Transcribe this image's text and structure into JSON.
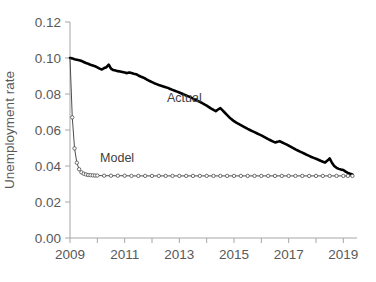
{
  "chart_data": {
    "type": "line",
    "title": "",
    "xlabel": "",
    "ylabel": "Unemployment rate",
    "xlim": [
      2009.0,
      2019.5
    ],
    "ylim": [
      0.0,
      0.12
    ],
    "grid": false,
    "legend_position": "inline-annotations",
    "y_ticks": [
      "0.00",
      "0.02",
      "0.04",
      "0.06",
      "0.08",
      "0.10",
      "0.12"
    ],
    "y_tick_values": [
      0.0,
      0.02,
      0.04,
      0.06,
      0.08,
      0.1,
      0.12
    ],
    "x_ticks": [
      "2009",
      "2011",
      "2013",
      "2015",
      "2017",
      "2019"
    ],
    "x_tick_values": [
      2009,
      2011,
      2013,
      2015,
      2017,
      2019
    ],
    "x_minor_tick_values": [
      2010,
      2012,
      2014,
      2016,
      2018
    ],
    "annotations": [
      {
        "text": "Actual",
        "x": 2012.55,
        "y": 0.0757
      },
      {
        "text": "Model",
        "x": 2010.1,
        "y": 0.0423
      }
    ],
    "series": [
      {
        "name": "Actual",
        "style": "thick-solid-black",
        "color": "#000000",
        "x": [
          2009.0,
          2009.083,
          2009.167,
          2009.25,
          2009.333,
          2009.417,
          2009.5,
          2009.583,
          2009.667,
          2009.75,
          2009.833,
          2009.917,
          2010.0,
          2010.083,
          2010.167,
          2010.25,
          2010.333,
          2010.417,
          2010.5,
          2010.583,
          2010.667,
          2010.75,
          2010.833,
          2010.917,
          2011.0,
          2011.083,
          2011.167,
          2011.25,
          2011.333,
          2011.417,
          2011.5,
          2011.583,
          2011.667,
          2011.75,
          2011.833,
          2011.917,
          2012.0,
          2012.083,
          2012.167,
          2012.25,
          2012.333,
          2012.417,
          2012.5,
          2012.583,
          2012.667,
          2012.75,
          2012.833,
          2012.917,
          2013.0,
          2013.083,
          2013.167,
          2013.25,
          2013.333,
          2013.417,
          2013.5,
          2013.583,
          2013.667,
          2013.75,
          2013.833,
          2013.917,
          2014.0,
          2014.083,
          2014.167,
          2014.25,
          2014.333,
          2014.417,
          2014.5,
          2014.583,
          2014.667,
          2014.75,
          2014.833,
          2014.917,
          2015.0,
          2015.083,
          2015.167,
          2015.25,
          2015.333,
          2015.417,
          2015.5,
          2015.583,
          2015.667,
          2015.75,
          2015.833,
          2015.917,
          2016.0,
          2016.083,
          2016.167,
          2016.25,
          2016.333,
          2016.417,
          2016.5,
          2016.583,
          2016.667,
          2016.75,
          2016.833,
          2016.917,
          2017.0,
          2017.083,
          2017.167,
          2017.25,
          2017.333,
          2017.417,
          2017.5,
          2017.583,
          2017.667,
          2017.75,
          2017.833,
          2017.917,
          2018.0,
          2018.083,
          2018.167,
          2018.25,
          2018.333,
          2018.417,
          2018.5,
          2018.583,
          2018.667,
          2018.75,
          2018.833,
          2018.917,
          2019.0,
          2019.083,
          2019.167,
          2019.25,
          2019.333
        ],
        "y": [
          0.1,
          0.0998,
          0.0993,
          0.099,
          0.0987,
          0.0984,
          0.0978,
          0.0972,
          0.0968,
          0.0962,
          0.0958,
          0.0954,
          0.0948,
          0.0941,
          0.0936,
          0.0944,
          0.0949,
          0.0963,
          0.0941,
          0.0933,
          0.093,
          0.0927,
          0.0925,
          0.0922,
          0.0919,
          0.0916,
          0.092,
          0.0917,
          0.0913,
          0.091,
          0.0903,
          0.0897,
          0.0892,
          0.0886,
          0.0879,
          0.0872,
          0.0866,
          0.086,
          0.0855,
          0.085,
          0.0846,
          0.0842,
          0.0838,
          0.0834,
          0.0828,
          0.0823,
          0.0818,
          0.0813,
          0.0808,
          0.0803,
          0.0797,
          0.0792,
          0.0787,
          0.0781,
          0.0774,
          0.0768,
          0.0762,
          0.0756,
          0.075,
          0.0742,
          0.0735,
          0.0727,
          0.0719,
          0.0712,
          0.0705,
          0.0714,
          0.0722,
          0.0709,
          0.0696,
          0.0683,
          0.067,
          0.0659,
          0.0649,
          0.0641,
          0.0634,
          0.0627,
          0.062,
          0.0613,
          0.0606,
          0.06,
          0.0594,
          0.0588,
          0.0582,
          0.0576,
          0.057,
          0.0563,
          0.0556,
          0.0549,
          0.0543,
          0.0537,
          0.0531,
          0.0534,
          0.0538,
          0.0532,
          0.0526,
          0.052,
          0.0513,
          0.0506,
          0.0499,
          0.0492,
          0.0486,
          0.048,
          0.0474,
          0.0468,
          0.0462,
          0.0456,
          0.045,
          0.0445,
          0.044,
          0.0435,
          0.0429,
          0.0424,
          0.0419,
          0.043,
          0.0442,
          0.0418,
          0.04,
          0.039,
          0.0384,
          0.038,
          0.0378,
          0.0369,
          0.0362,
          0.0357,
          0.0353
        ]
      },
      {
        "name": "Model",
        "style": "thin-line-open-circle-markers",
        "color": "#4d4d4d",
        "marker": "open-circle",
        "x": [
          2009.0,
          2009.083,
          2009.167,
          2009.25,
          2009.333,
          2009.417,
          2009.5,
          2009.583,
          2009.667,
          2009.75,
          2009.833,
          2009.917,
          2010.0,
          2010.25,
          2010.5,
          2010.75,
          2011.0,
          2011.25,
          2011.5,
          2011.75,
          2012.0,
          2012.25,
          2012.5,
          2012.75,
          2013.0,
          2013.25,
          2013.5,
          2013.75,
          2014.0,
          2014.25,
          2014.5,
          2014.75,
          2015.0,
          2015.25,
          2015.5,
          2015.75,
          2016.0,
          2016.25,
          2016.5,
          2016.75,
          2017.0,
          2017.25,
          2017.5,
          2017.75,
          2018.0,
          2018.25,
          2018.5,
          2018.75,
          2019.0,
          2019.167,
          2019.333
        ],
        "y": [
          0.1,
          0.067,
          0.0498,
          0.0418,
          0.0382,
          0.0365,
          0.0357,
          0.0353,
          0.035,
          0.0349,
          0.0348,
          0.0347,
          0.0347,
          0.0346,
          0.0346,
          0.0346,
          0.0346,
          0.0345,
          0.0345,
          0.0345,
          0.0345,
          0.0345,
          0.0345,
          0.0345,
          0.0345,
          0.0345,
          0.0345,
          0.0345,
          0.0345,
          0.0345,
          0.0345,
          0.0345,
          0.0345,
          0.0345,
          0.0345,
          0.0345,
          0.0345,
          0.0345,
          0.0345,
          0.0345,
          0.0345,
          0.0345,
          0.0345,
          0.0345,
          0.0345,
          0.0345,
          0.0345,
          0.0345,
          0.0345,
          0.0345,
          0.0345
        ]
      }
    ]
  }
}
